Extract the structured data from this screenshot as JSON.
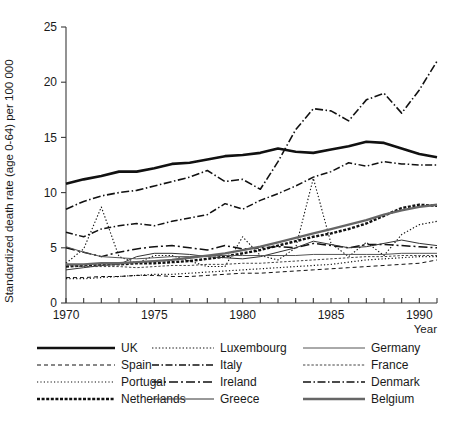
{
  "chart_data": {
    "type": "line",
    "title": "",
    "xlabel": "Year",
    "ylabel": "Standardized death rate (age 0-64) per 100 000",
    "xlim": [
      1970,
      1991
    ],
    "ylim": [
      0,
      25
    ],
    "xticks": [
      1970,
      1975,
      1980,
      1985,
      1990
    ],
    "xtick_labels": [
      "1970",
      "1975",
      "1980",
      "1985",
      "1990"
    ],
    "xtick_minor_step": 1,
    "yticks": [
      0,
      5,
      10,
      15,
      20,
      25
    ],
    "ytick_labels": [
      "0",
      "5",
      "10",
      "15",
      "20",
      "25"
    ],
    "grid": false,
    "legend_position": "below",
    "legend_columns": 3,
    "legend_rows": 4,
    "x": [
      1970,
      1971,
      1972,
      1973,
      1974,
      1975,
      1976,
      1977,
      1978,
      1979,
      1980,
      1981,
      1982,
      1983,
      1984,
      1985,
      1986,
      1987,
      1988,
      1989,
      1990,
      1991
    ],
    "series": [
      {
        "name": "UK",
        "style": "solid-thick",
        "color": "#111111",
        "width": 2.6,
        "dash": "",
        "values": [
          10.8,
          11.2,
          11.5,
          11.9,
          11.9,
          12.2,
          12.6,
          12.7,
          13.0,
          13.3,
          13.4,
          13.6,
          14.0,
          13.7,
          13.6,
          13.9,
          14.2,
          14.6,
          14.5,
          14.0,
          13.5,
          13.2
        ]
      },
      {
        "name": "Spain",
        "style": "dashed",
        "color": "#111111",
        "width": 1.0,
        "dash": "4 3",
        "values": [
          2.3,
          2.3,
          2.4,
          2.4,
          2.5,
          2.5,
          2.4,
          2.4,
          2.5,
          2.6,
          2.7,
          2.7,
          2.8,
          2.9,
          3.0,
          3.1,
          3.2,
          3.3,
          3.4,
          3.5,
          3.6,
          3.9
        ]
      },
      {
        "name": "Portugal",
        "style": "dotted",
        "color": "#111111",
        "width": 1.2,
        "dash": "1.2 2.2",
        "values": [
          2.2,
          2.2,
          2.3,
          2.4,
          2.5,
          2.6,
          2.6,
          2.7,
          2.8,
          2.9,
          3.0,
          3.1,
          3.2,
          3.3,
          3.4,
          3.5,
          3.7,
          3.9,
          4.0,
          4.1,
          4.2,
          4.2
        ]
      },
      {
        "name": "Netherlands",
        "style": "dashed-thick-dense",
        "color": "#111111",
        "width": 2.4,
        "dash": "3 1.6",
        "values": [
          3.3,
          3.4,
          3.5,
          3.5,
          3.6,
          3.6,
          3.7,
          3.8,
          4.0,
          4.2,
          4.5,
          4.8,
          5.2,
          5.6,
          6.0,
          6.3,
          6.7,
          7.2,
          7.9,
          8.6,
          8.9,
          8.8
        ]
      },
      {
        "name": "Luxembourg",
        "style": "fine-dotted",
        "color": "#111111",
        "width": 1.1,
        "dash": "1.4 2.0",
        "values": [
          3.6,
          4.9,
          8.7,
          4.2,
          3.6,
          4.3,
          4.3,
          3.8,
          3.3,
          3.3,
          6.0,
          4.3,
          3.9,
          5.0,
          11.3,
          5.4,
          4.2,
          5.5,
          4.3,
          6.2,
          7.1,
          7.4
        ]
      },
      {
        "name": "Italy",
        "style": "dash-dot",
        "color": "#111111",
        "width": 1.5,
        "dash": "7 2.5 1.5 2.5",
        "values": [
          6.4,
          6.0,
          6.7,
          7.0,
          7.2,
          7.0,
          7.4,
          7.7,
          8.0,
          9.0,
          8.5,
          9.3,
          9.9,
          10.6,
          11.4,
          11.9,
          12.7,
          12.4,
          12.8,
          12.6,
          12.5,
          12.5
        ]
      },
      {
        "name": "Ireland",
        "style": "long-dash-dot",
        "color": "#111111",
        "width": 1.5,
        "dash": "9 3 2 3",
        "values": [
          5.0,
          4.6,
          4.2,
          4.6,
          4.9,
          5.1,
          5.2,
          5.0,
          4.8,
          5.2,
          4.9,
          5.0,
          5.1,
          5.0,
          5.4,
          5.2,
          5.0,
          5.3,
          5.3,
          5.2,
          5.1,
          5.0
        ]
      },
      {
        "name": "Greece",
        "style": "thin-solid",
        "color": "#333333",
        "width": 1.0,
        "dash": "",
        "values": [
          3.0,
          3.2,
          3.4,
          3.5,
          4.2,
          4.5,
          4.5,
          4.4,
          4.2,
          4.1,
          4.0,
          4.2,
          4.6,
          5.0,
          5.6,
          5.3,
          5.0,
          5.1,
          5.4,
          5.7,
          5.4,
          5.2
        ]
      },
      {
        "name": "Germany",
        "style": "thin-solid",
        "color": "#555555",
        "width": 1.0,
        "dash": "",
        "values": [
          5.1,
          4.6,
          4.2,
          4.1,
          4.0,
          4.1,
          4.2,
          4.2,
          4.3,
          4.3,
          4.3,
          4.3,
          4.3,
          4.3,
          4.4,
          4.4,
          4.4,
          4.4,
          4.4,
          4.5,
          4.5,
          4.5
        ]
      },
      {
        "name": "France",
        "style": "fine-dashed",
        "color": "#444444",
        "width": 1.0,
        "dash": "2.4 1.8",
        "values": [
          3.4,
          3.3,
          3.3,
          3.3,
          3.2,
          3.3,
          3.4,
          3.4,
          3.5,
          3.5,
          3.6,
          3.6,
          3.7,
          3.8,
          3.9,
          4.0,
          4.1,
          4.2,
          4.2,
          4.3,
          4.3,
          4.3
        ]
      },
      {
        "name": "Denmark",
        "style": "dash-dot",
        "color": "#111111",
        "width": 1.6,
        "dash": "8 2.5 1.5 2.5",
        "values": [
          8.5,
          9.2,
          9.7,
          10.0,
          10.2,
          10.6,
          11.0,
          11.4,
          12.0,
          11.0,
          11.2,
          10.3,
          12.8,
          15.7,
          17.6,
          17.4,
          16.5,
          18.4,
          19.0,
          17.2,
          19.3,
          21.9
        ]
      },
      {
        "name": "Belgium",
        "style": "solid-thick-gray",
        "color": "#666666",
        "width": 2.3,
        "dash": "",
        "values": [
          3.5,
          3.5,
          3.6,
          3.6,
          3.7,
          3.8,
          3.9,
          4.1,
          4.3,
          4.5,
          4.8,
          5.1,
          5.5,
          5.9,
          6.3,
          6.7,
          7.1,
          7.5,
          8.0,
          8.4,
          8.7,
          8.9
        ]
      }
    ]
  },
  "legend": {
    "entries": [
      {
        "label": "UK"
      },
      {
        "label": "Luxembourg"
      },
      {
        "label": "Germany"
      },
      {
        "label": "Spain"
      },
      {
        "label": "Italy"
      },
      {
        "label": "France"
      },
      {
        "label": "Portugal"
      },
      {
        "label": "Ireland"
      },
      {
        "label": "Denmark"
      },
      {
        "label": "Netherlands"
      },
      {
        "label": "Greece"
      },
      {
        "label": "Belgium"
      }
    ]
  }
}
